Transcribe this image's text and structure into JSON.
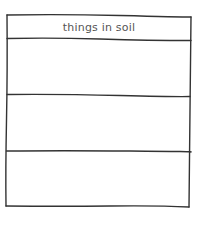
{
  "worksheet": {
    "header": "things in soil",
    "rows": [
      {
        "label": ""
      },
      {
        "label": ""
      },
      {
        "label": ""
      }
    ],
    "line_color": "#333333",
    "text_color": "#555555"
  }
}
